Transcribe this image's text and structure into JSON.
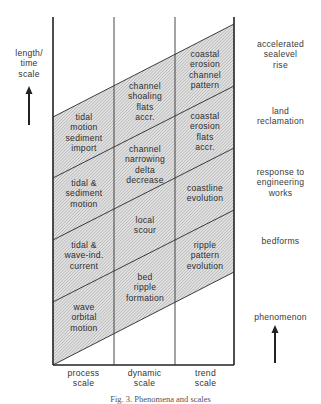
{
  "figure": {
    "caption": "Fig. 3. Phenomena and scales",
    "y_axis": {
      "label": "length/\ntime\nscale",
      "arrow": "up-arrow"
    },
    "columns": [
      {
        "label": "process\nscale"
      },
      {
        "label": "dynamic\nscale"
      },
      {
        "label": "trend\nscale"
      }
    ],
    "cells": {
      "process": [
        "tidal\nmotion\nsediment\nimport",
        "tidal &\nsediment\nmotion",
        "tidal &\nwave-ind.\ncurrent",
        "wave\norbital\nmotion"
      ],
      "dynamic": [
        "channel\nshoaling\nflats\naccr.",
        "channel\nnarrowing\ndelta\ndecrease",
        "local\nscour",
        "bed\nripple\nformation"
      ],
      "trend": [
        "coastal\nerosion\nchannel\npattern",
        "coastal\nerosion\nflats\naccr.",
        "coastline\nevolution",
        "ripple\npattern\nevolution"
      ]
    },
    "phenomena": {
      "label": "phenomenon",
      "arrow": "up-arrow",
      "items": [
        "accelerated\nsealevel\nrise",
        "land\nreclamation",
        "response to\nengineering\nworks",
        "bedforms"
      ]
    },
    "colors": {
      "line": "#2a2a2a",
      "hatch": "#9a9a9a",
      "hatch_bg": "#e4e4e4"
    }
  }
}
